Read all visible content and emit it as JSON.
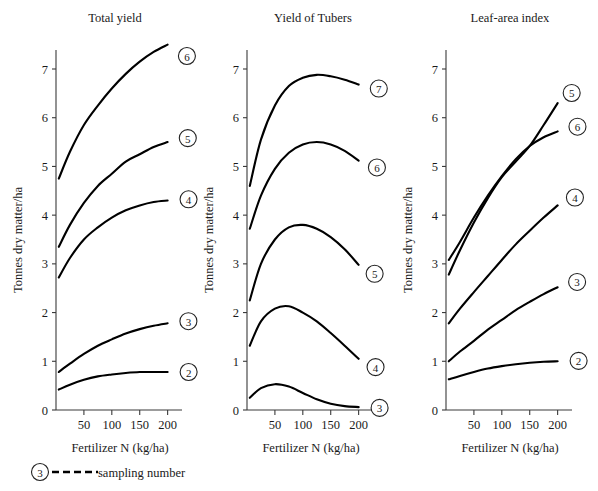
{
  "figure": {
    "axis_title_y": "Tonnes dry matter/ha",
    "axis_title_x": "Fertilizer N (kg/ha)",
    "legend": {
      "marker": "3",
      "label": "sampling number",
      "line_style": "dashed"
    },
    "colors": {
      "curve": "#000000",
      "axis": "#3a3a3a",
      "text": "#1a1a1a",
      "background": "#ffffff"
    }
  },
  "chart_data": [
    {
      "type": "line",
      "title": "Total yield",
      "xlabel": "Fertilizer N (kg/ha)",
      "ylabel": "Tonnes dry matter/ha",
      "xlim": [
        0,
        215
      ],
      "ylim": [
        0,
        7.6
      ],
      "xticks": [
        50,
        100,
        150,
        200
      ],
      "yticks": [
        0,
        1,
        2,
        3,
        4,
        5,
        6,
        7
      ],
      "grid": false,
      "legend_position": "curve-end-labels",
      "x": [
        5,
        25,
        50,
        75,
        100,
        125,
        150,
        175,
        200
      ],
      "series": [
        {
          "name": "6",
          "label": "6",
          "values": [
            4.75,
            5.3,
            5.85,
            6.25,
            6.6,
            6.9,
            7.15,
            7.35,
            7.5
          ]
        },
        {
          "name": "5",
          "label": "5",
          "values": [
            3.35,
            3.8,
            4.25,
            4.6,
            4.85,
            5.1,
            5.25,
            5.4,
            5.5
          ]
        },
        {
          "name": "4",
          "label": "4",
          "values": [
            2.72,
            3.12,
            3.5,
            3.75,
            3.95,
            4.1,
            4.2,
            4.27,
            4.3
          ]
        },
        {
          "name": "3",
          "label": "3",
          "values": [
            0.78,
            0.95,
            1.15,
            1.32,
            1.45,
            1.57,
            1.66,
            1.73,
            1.78
          ]
        },
        {
          "name": "2",
          "label": "2",
          "values": [
            0.42,
            0.52,
            0.62,
            0.69,
            0.73,
            0.76,
            0.78,
            0.78,
            0.78
          ]
        }
      ]
    },
    {
      "type": "line",
      "title": "Yield of Tubers",
      "xlabel": "Fertilizer N (kg/ha)",
      "ylabel": "Tonnes dry matter/ha",
      "xlim": [
        0,
        215
      ],
      "ylim": [
        0,
        7.6
      ],
      "xticks": [
        50,
        100,
        150,
        200
      ],
      "yticks": [
        0,
        1,
        2,
        3,
        4,
        5,
        6,
        7
      ],
      "grid": false,
      "legend_position": "curve-end-labels",
      "x": [
        5,
        25,
        50,
        75,
        100,
        125,
        150,
        175,
        200
      ],
      "series": [
        {
          "name": "7",
          "label": "7",
          "values": [
            4.6,
            5.55,
            6.25,
            6.65,
            6.82,
            6.88,
            6.85,
            6.78,
            6.68
          ]
        },
        {
          "name": "6",
          "label": "6",
          "values": [
            3.72,
            4.4,
            4.95,
            5.28,
            5.45,
            5.5,
            5.45,
            5.32,
            5.12
          ]
        },
        {
          "name": "5",
          "label": "5",
          "values": [
            2.25,
            3.0,
            3.5,
            3.75,
            3.8,
            3.72,
            3.55,
            3.3,
            2.98
          ]
        },
        {
          "name": "4",
          "label": "4",
          "values": [
            1.32,
            1.82,
            2.08,
            2.13,
            2.0,
            1.82,
            1.58,
            1.32,
            1.05
          ]
        },
        {
          "name": "3",
          "label": "3",
          "values": [
            0.25,
            0.45,
            0.53,
            0.48,
            0.35,
            0.22,
            0.13,
            0.08,
            0.06
          ]
        }
      ]
    },
    {
      "type": "line",
      "title": "Leaf-area index",
      "xlabel": "Fertilizer N (kg/ha)",
      "ylabel": "Tonnes dry matter/ha",
      "xlim": [
        0,
        215
      ],
      "ylim": [
        0,
        7.6
      ],
      "xticks": [
        50,
        100,
        150,
        200
      ],
      "yticks": [
        0,
        1,
        2,
        3,
        4,
        5,
        6,
        7
      ],
      "grid": false,
      "legend_position": "curve-end-labels",
      "x": [
        5,
        25,
        50,
        75,
        100,
        125,
        150,
        175,
        200
      ],
      "series": [
        {
          "name": "5",
          "label": "5",
          "values": [
            2.78,
            3.28,
            3.85,
            4.35,
            4.78,
            5.1,
            5.42,
            5.85,
            6.3
          ]
        },
        {
          "name": "6",
          "label": "6",
          "values": [
            3.08,
            3.45,
            3.95,
            4.4,
            4.8,
            5.15,
            5.42,
            5.6,
            5.72
          ]
        },
        {
          "name": "4",
          "label": "4",
          "values": [
            1.78,
            2.08,
            2.42,
            2.75,
            3.08,
            3.4,
            3.68,
            3.95,
            4.2
          ]
        },
        {
          "name": "3",
          "label": "3",
          "values": [
            1.0,
            1.2,
            1.42,
            1.65,
            1.85,
            2.05,
            2.22,
            2.38,
            2.52
          ]
        },
        {
          "name": "2",
          "label": "2",
          "values": [
            0.63,
            0.7,
            0.78,
            0.85,
            0.9,
            0.94,
            0.97,
            0.99,
            1.0
          ]
        }
      ]
    }
  ]
}
